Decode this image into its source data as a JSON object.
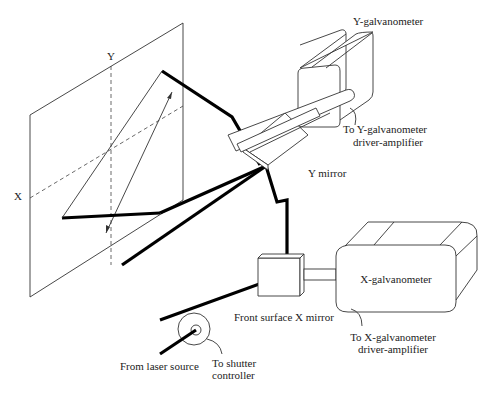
{
  "diagram": {
    "type": "laser galvanometer scanning system",
    "labels": {
      "y_axis": "Y",
      "x_axis": "X",
      "y_galvanometer": "Y-galvanometer",
      "y_driver_line1": "To Y-galvanometer",
      "y_driver_line2": "driver-amplifier",
      "y_mirror": "Y mirror",
      "x_galvanometer": "X-galvanometer",
      "x_mirror": "Front surface X mirror",
      "x_driver_line1": "To X-galvanometer",
      "x_driver_line2": "driver-amplifier",
      "laser_source": "From laser source",
      "shutter_line1": "To shutter",
      "shutter_line2": "controller"
    },
    "colors": {
      "line": "#333333",
      "beam": "#000000",
      "background": "#ffffff"
    }
  }
}
